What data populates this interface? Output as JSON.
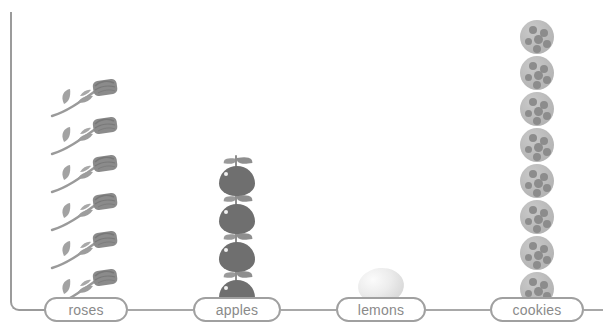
{
  "chart_data": {
    "type": "bar",
    "subtype": "pictograph",
    "title": "",
    "subtitle": "",
    "xlabel": "",
    "ylabel": "",
    "orientation": "vertical",
    "grid": false,
    "legend": null,
    "ylim": [
      0,
      8
    ],
    "categories": [
      "roses",
      "apples",
      "lemons",
      "cookies"
    ],
    "values": [
      6,
      4,
      1,
      8
    ],
    "units": "icons",
    "icon_per_category": [
      "rose-icon",
      "apple-icon",
      "lemon-icon",
      "cookie-icon"
    ],
    "series": [
      {
        "name": "count",
        "values": [
          6,
          4,
          1,
          8
        ]
      }
    ]
  },
  "axis": {
    "name": "y-axis-line",
    "color": "#9b9b9b"
  },
  "columns": [
    {
      "key": "roses",
      "label": "roses",
      "count": 6,
      "icon": "rose-icon",
      "center_x": 86,
      "pill_left": 44,
      "pill_width": 84,
      "icon_width": 72,
      "icon_height": 40,
      "bottom": 24,
      "spacing": 38
    },
    {
      "key": "apples",
      "label": "apples",
      "count": 4,
      "icon": "apple-icon",
      "center_x": 237,
      "pill_left": 193,
      "pill_width": 88,
      "icon_width": 44,
      "icon_height": 42,
      "bottom": 22,
      "spacing": 38
    },
    {
      "key": "lemons",
      "label": "lemons",
      "count": 1,
      "icon": "lemon-icon",
      "center_x": 381,
      "pill_left": 336,
      "pill_width": 90,
      "icon_width": 46,
      "icon_height": 36,
      "bottom": 28,
      "spacing": 38
    },
    {
      "key": "cookies",
      "label": "cookies",
      "count": 8,
      "icon": "cookie-icon",
      "center_x": 537,
      "pill_left": 490,
      "pill_width": 94,
      "icon_width": 34,
      "icon_height": 34,
      "bottom": 26,
      "spacing": 36
    }
  ],
  "connectors": [
    {
      "left": 128,
      "width": 65
    },
    {
      "left": 281,
      "width": 55
    },
    {
      "left": 426,
      "width": 64
    },
    {
      "left": 584,
      "width": 19
    }
  ],
  "colors": {
    "axis": "#9b9b9b",
    "pill_border": "#a0a0a0",
    "label_text": "#8a8a8a",
    "connector": "#a8a8a8",
    "apple": "#6f6f6f",
    "rose": "#8d8d8d",
    "lemon": "#e6e6e6",
    "cookie": "#b9b9b9",
    "cookie_chip": "#8c8c8c",
    "background": "#ffffff"
  }
}
